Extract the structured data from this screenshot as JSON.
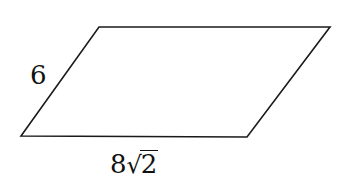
{
  "figure": {
    "shape": "parallelogram",
    "vertices": {
      "top_left": [
        99,
        27
      ],
      "top_right": [
        330,
        27
      ],
      "bottom_right": [
        247,
        137
      ],
      "bottom_left": [
        21,
        136
      ]
    },
    "stroke_color": "#1a1a1a"
  },
  "labels": {
    "side": "6",
    "base_coefficient": "8",
    "base_radical_symbol": "√",
    "base_radicand": "2"
  }
}
